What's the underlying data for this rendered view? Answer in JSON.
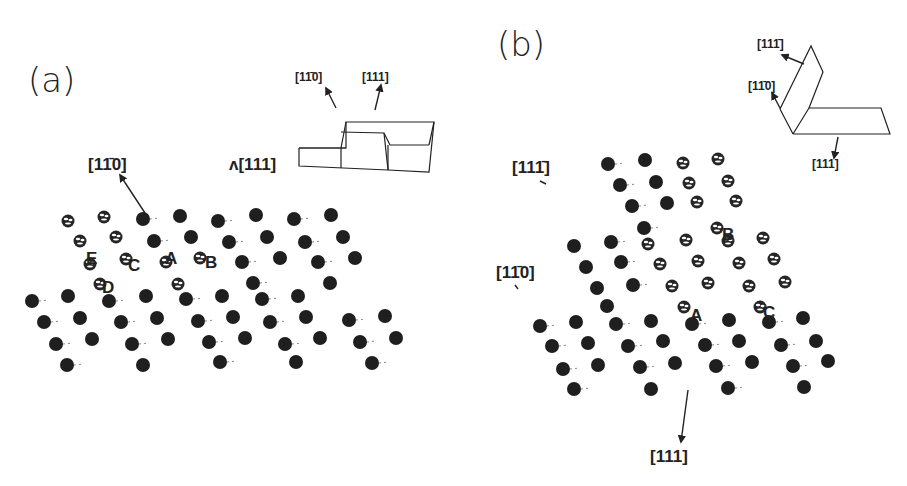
{
  "figure": {
    "panels": [
      {
        "id": "a",
        "label": "(a)",
        "label_pos": [
          28,
          92
        ],
        "directions": [
          {
            "text": "[1̄1̄ 0]",
            "display": "[11̄0]",
            "x": 88,
            "y": 170,
            "size": 17,
            "arrow": [
              [
                120,
                175
              ],
              [
                145,
                213
              ]
            ],
            "arrowhead_at_start": true
          },
          {
            "text": "[111]",
            "display": "[111]",
            "x": 229,
            "y": 170,
            "size": 17,
            "prefix": "ʌ"
          }
        ],
        "inset": {
          "labels": [
            {
              "display": "[11̄0]",
              "x": 295,
              "y": 81,
              "size": 12
            },
            {
              "display": "[111]",
              "x": 362,
              "y": 81,
              "size": 12
            }
          ],
          "arrows": [
            [
              [
                336,
                108
              ],
              [
                326,
                88
              ]
            ],
            [
              [
                375,
                110
              ],
              [
                381,
                85
              ]
            ]
          ],
          "polylines": [
            [
              [
                299,
                148
              ],
              [
                346,
                148
              ],
              [
                346,
                122
              ],
              [
                434,
                122
              ],
              [
                429,
                172
              ],
              [
                388,
                170
              ],
              [
                299,
                166
              ],
              [
                299,
                148
              ]
            ],
            [
              [
                346,
                122
              ],
              [
                341,
                148
              ],
              [
                341,
                168
              ]
            ],
            [
              [
                341,
                132
              ],
              [
                384,
                133
              ],
              [
                390,
                145
              ],
              [
                429,
                145
              ]
            ],
            [
              [
                384,
                133
              ],
              [
                388,
                170
              ]
            ],
            [
              [
                346,
                148
              ],
              [
                299,
                148
              ]
            ],
            [
              [
                434,
                122
              ],
              [
                429,
                145
              ]
            ],
            [
              [
                388,
                145
              ],
              [
                388,
                170
              ]
            ]
          ]
        },
        "sites": [
          {
            "name": "E",
            "x": 86,
            "y": 258
          },
          {
            "name": "C",
            "x": 128,
            "y": 265
          },
          {
            "name": "A",
            "x": 165,
            "y": 258
          },
          {
            "name": "B",
            "x": 205,
            "y": 262
          },
          {
            "name": "D",
            "x": 102,
            "y": 287
          }
        ],
        "adatoms": [
          [
            68,
            221
          ],
          [
            104,
            217
          ],
          [
            80,
            241
          ],
          [
            116,
            237
          ],
          [
            90,
            264
          ],
          [
            126,
            259
          ],
          [
            166,
            262
          ],
          [
            100,
            284
          ],
          [
            178,
            284
          ],
          [
            200,
            258
          ]
        ],
        "atoms": [
          [
            143,
            219
          ],
          [
            180,
            216
          ],
          [
            218,
            221
          ],
          [
            256,
            215
          ],
          [
            294,
            219
          ],
          [
            331,
            215
          ],
          [
            154,
            241
          ],
          [
            191,
            237
          ],
          [
            229,
            242
          ],
          [
            267,
            237
          ],
          [
            305,
            242
          ],
          [
            343,
            237
          ],
          [
            242,
            262
          ],
          [
            280,
            258
          ],
          [
            318,
            262
          ],
          [
            355,
            258
          ],
          [
            253,
            283
          ],
          [
            330,
            283
          ],
          [
            32,
            301
          ],
          [
            68,
            296
          ],
          [
            109,
            301
          ],
          [
            146,
            296
          ],
          [
            186,
            299
          ],
          [
            222,
            296
          ],
          [
            262,
            299
          ],
          [
            298,
            296
          ],
          [
            44,
            322
          ],
          [
            80,
            318
          ],
          [
            121,
            322
          ],
          [
            157,
            318
          ],
          [
            198,
            321
          ],
          [
            233,
            317
          ],
          [
            270,
            322
          ],
          [
            306,
            317
          ],
          [
            349,
            320
          ],
          [
            385,
            316
          ],
          [
            56,
            344
          ],
          [
            92,
            339
          ],
          [
            132,
            344
          ],
          [
            168,
            339
          ],
          [
            209,
            342
          ],
          [
            245,
            338
          ],
          [
            285,
            344
          ],
          [
            320,
            338
          ],
          [
            360,
            342
          ],
          [
            396,
            338
          ],
          [
            67,
            365
          ],
          [
            143,
            365
          ],
          [
            220,
            362
          ],
          [
            296,
            362
          ],
          [
            372,
            363
          ]
        ]
      },
      {
        "id": "b",
        "label": "(b)",
        "label_pos": [
          497,
          56
        ],
        "directions": [
          {
            "display": "[111̄]",
            "x": 512,
            "y": 173,
            "size": 17,
            "tick": [
              [
                540,
                181
              ],
              [
                546,
                184
              ]
            ]
          },
          {
            "display": "[11̄0]",
            "x": 496,
            "y": 278,
            "size": 17,
            "tick": [
              [
                515,
                285
              ],
              [
                518,
                289
              ]
            ]
          },
          {
            "display": "[111]",
            "x": 650,
            "y": 462,
            "size": 17,
            "arrow": [
              [
                688,
                390
              ],
              [
                681,
                442
              ]
            ],
            "arrowhead_at_end": true
          }
        ],
        "inset": {
          "labels": [
            {
              "display": "[111̄]",
              "x": 757,
              "y": 48,
              "size": 12
            },
            {
              "display": "[11̄0]",
              "x": 748,
              "y": 90,
              "size": 12
            },
            {
              "display": "[111]",
              "x": 812,
              "y": 168,
              "size": 12
            }
          ],
          "arrows": [
            [
              [
                804,
                64
              ],
              [
                782,
                55
              ]
            ],
            [
              [
                780,
                108
              ],
              [
                772,
                93
              ]
            ],
            [
              [
                838,
                137
              ],
              [
                834,
                158
              ]
            ]
          ],
          "polylines": [
            [
              [
                793,
                134
              ],
              [
                809,
                108
              ],
              [
                881,
                108
              ],
              [
                890,
                134
              ],
              [
                793,
                134
              ]
            ],
            [
              [
                793,
                134
              ],
              [
                780,
                109
              ],
              [
                811,
                46
              ],
              [
                823,
                72
              ],
              [
                809,
                108
              ]
            ]
          ]
        },
        "sites": [
          {
            "name": "B",
            "x": 722,
            "y": 234
          },
          {
            "name": "A",
            "x": 690,
            "y": 315
          },
          {
            "name": "C",
            "x": 763,
            "y": 312
          }
        ],
        "adatoms": [
          [
            683,
            163
          ],
          [
            718,
            159
          ],
          [
            689,
            183
          ],
          [
            728,
            181
          ],
          [
            697,
            202
          ],
          [
            736,
            201
          ],
          [
            717,
            228
          ],
          [
            648,
            244
          ],
          [
            686,
            240
          ],
          [
            728,
            241
          ],
          [
            763,
            238
          ],
          [
            660,
            264
          ],
          [
            698,
            261
          ],
          [
            739,
            263
          ],
          [
            774,
            259
          ],
          [
            672,
            286
          ],
          [
            708,
            283
          ],
          [
            749,
            286
          ],
          [
            785,
            282
          ],
          [
            684,
            307
          ],
          [
            760,
            307
          ]
        ],
        "atoms": [
          [
            608,
            164
          ],
          [
            645,
            160
          ],
          [
            620,
            185
          ],
          [
            656,
            182
          ],
          [
            632,
            206
          ],
          [
            667,
            203
          ],
          [
            644,
            228
          ],
          [
            574,
            246
          ],
          [
            611,
            242
          ],
          [
            586,
            267
          ],
          [
            621,
            262
          ],
          [
            597,
            288
          ],
          [
            633,
            285
          ],
          [
            607,
            306
          ],
          [
            540,
            326
          ],
          [
            576,
            322
          ],
          [
            616,
            324
          ],
          [
            651,
            321
          ],
          [
            692,
            324
          ],
          [
            729,
            320
          ],
          [
            769,
            322
          ],
          [
            803,
            318
          ],
          [
            552,
            346
          ],
          [
            588,
            343
          ],
          [
            628,
            346
          ],
          [
            663,
            341
          ],
          [
            705,
            345
          ],
          [
            739,
            341
          ],
          [
            781,
            345
          ],
          [
            816,
            341
          ],
          [
            563,
            369
          ],
          [
            598,
            365
          ],
          [
            640,
            367
          ],
          [
            675,
            363
          ],
          [
            716,
            366
          ],
          [
            752,
            362
          ],
          [
            793,
            366
          ],
          [
            828,
            361
          ],
          [
            574,
            389
          ],
          [
            651,
            389
          ],
          [
            728,
            388
          ],
          [
            804,
            387
          ]
        ]
      }
    ],
    "atom_radius": 7,
    "adatom_radius": 6.5
  }
}
